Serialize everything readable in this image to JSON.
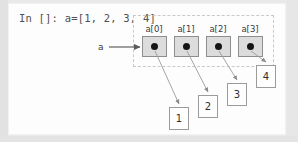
{
  "diagram": {
    "title_code": "In []: a=[1, 2, 3, 4]",
    "variable_label": "a",
    "colors": {
      "cell_fill": "#dcdcdc",
      "cell_border": "#8e8e8e",
      "dot": "#151515",
      "container_border": "#c9c9c9",
      "arrow": "#8a8a8a",
      "canvas_bg": "#fdfdfd",
      "page_bg": "#e9e9e9",
      "text": "#3a3a3a"
    },
    "cells": [
      {
        "label": "a[0]",
        "x": 133,
        "y": 32,
        "label_x": 131,
        "label_y": 20
      },
      {
        "label": "a[1]",
        "x": 165,
        "y": 32,
        "label_x": 163,
        "label_y": 20
      },
      {
        "label": "a[2]",
        "x": 197,
        "y": 32,
        "label_x": 195,
        "label_y": 20
      },
      {
        "label": "a[3]",
        "x": 229,
        "y": 32,
        "label_x": 227,
        "label_y": 20
      }
    ],
    "values": [
      {
        "value": "1",
        "x": 160,
        "y": 103
      },
      {
        "value": "2",
        "x": 189,
        "y": 91
      },
      {
        "value": "3",
        "x": 218,
        "y": 79
      },
      {
        "value": "4",
        "x": 247,
        "y": 61
      }
    ],
    "var_arrow": {
      "x1": 100,
      "y1": 43,
      "x2": 131,
      "y2": 43
    },
    "pointer_arrows": [
      {
        "x1": 146,
        "y1": 47,
        "x2": 170,
        "y2": 100
      },
      {
        "x1": 178,
        "y1": 47,
        "x2": 199,
        "y2": 88
      },
      {
        "x1": 210,
        "y1": 47,
        "x2": 228,
        "y2": 76
      },
      {
        "x1": 242,
        "y1": 47,
        "x2": 257,
        "y2": 58
      }
    ]
  }
}
